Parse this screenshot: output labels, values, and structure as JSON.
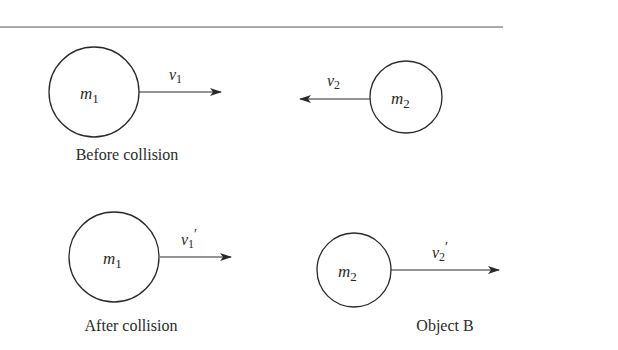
{
  "diagram": {
    "before": {
      "caption": "Before collision",
      "object1": {
        "mass_symbol": "m",
        "mass_sub": "1",
        "velocity_symbol": "v",
        "velocity_sub": "1",
        "prime": "",
        "direction": "right"
      },
      "object2": {
        "mass_symbol": "m",
        "mass_sub": "2",
        "velocity_symbol": "v",
        "velocity_sub": "2",
        "prime": "",
        "direction": "left"
      }
    },
    "after": {
      "caption": "After collision",
      "object1": {
        "mass_symbol": "m",
        "mass_sub": "1",
        "velocity_symbol": "v",
        "velocity_sub": "1",
        "prime": "′",
        "direction": "right"
      },
      "object2": {
        "mass_symbol": "m",
        "mass_sub": "2",
        "velocity_symbol": "v",
        "velocity_sub": "2",
        "prime": "′",
        "direction": "right",
        "caption": "Object B"
      }
    },
    "colors": {
      "stroke": "#2a2a2a",
      "background": "#ffffff"
    }
  }
}
